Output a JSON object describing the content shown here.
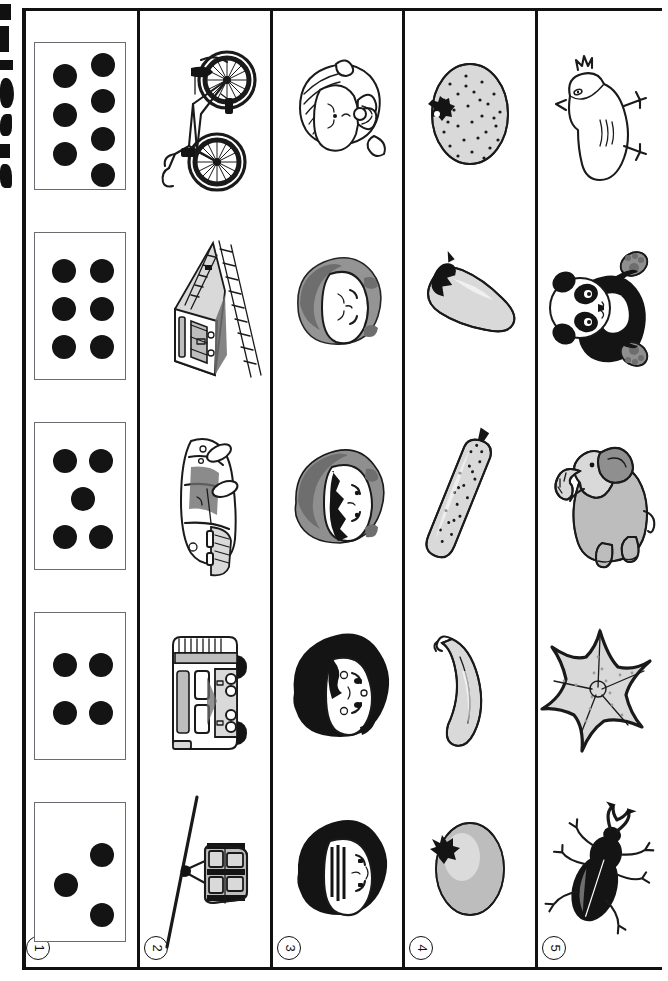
{
  "worksheet": {
    "title": "Matching worksheet: dot cards, vehicles, children, produce, animals",
    "orientation": "rotated-90",
    "frame_color": "#111111",
    "background_color": "#ffffff",
    "column_count": 5,
    "row_count": 5
  },
  "columns": [
    {
      "number": "1",
      "number_glyph": "①",
      "name": "dot-cards",
      "items": [
        {
          "name": "dot-card-seven",
          "dot_count": 7,
          "pattern": "3-left-4-right",
          "dots": [
            [
              30,
              33
            ],
            [
              30,
              72
            ],
            [
              30,
              111
            ],
            [
              68,
              22
            ],
            [
              68,
              58
            ],
            [
              68,
              96
            ],
            [
              68,
              132
            ]
          ]
        },
        {
          "name": "dot-card-six",
          "dot_count": 6,
          "pattern": "two-columns-of-three",
          "dots": [
            [
              29,
              38
            ],
            [
              29,
              76
            ],
            [
              29,
              114
            ],
            [
              67,
              38
            ],
            [
              67,
              76
            ],
            [
              67,
              114
            ]
          ]
        },
        {
          "name": "dot-card-five",
          "dot_count": 5,
          "pattern": "quincunx",
          "dots": [
            [
              30,
              38
            ],
            [
              66,
              38
            ],
            [
              48,
              76
            ],
            [
              30,
              114
            ],
            [
              66,
              114
            ]
          ]
        },
        {
          "name": "dot-card-four",
          "dot_count": 4,
          "pattern": "square",
          "dots": [
            [
              30,
              52
            ],
            [
              66,
              52
            ],
            [
              30,
              100
            ],
            [
              66,
              100
            ]
          ]
        },
        {
          "name": "dot-card-three",
          "dot_count": 3,
          "pattern": "diagonal",
          "dots": [
            [
              31,
              82
            ],
            [
              67,
              52
            ],
            [
              67,
              112
            ]
          ]
        }
      ]
    },
    {
      "number": "2",
      "number_glyph": "②",
      "name": "vehicles",
      "items": [
        {
          "name": "bicycle-picture",
          "label": "bicycle"
        },
        {
          "name": "train-picture",
          "label": "train on tracks"
        },
        {
          "name": "car-picture",
          "label": "car"
        },
        {
          "name": "bus-picture",
          "label": "bus"
        },
        {
          "name": "cable-car-picture",
          "label": "cable car gondola"
        }
      ]
    },
    {
      "number": "3",
      "number_glyph": "③",
      "name": "children-faces",
      "items": [
        {
          "name": "child-face-with-bow-picture",
          "label": "girl with ribbon bow"
        },
        {
          "name": "child-face-short-hair-picture",
          "label": "child with short hair"
        },
        {
          "name": "child-face-bangs-picture",
          "label": "child with bangs"
        },
        {
          "name": "child-face-dark-hair-picture",
          "label": "girl with dark curly hair"
        },
        {
          "name": "child-face-cap-picture",
          "label": "boy with straight hair"
        }
      ]
    },
    {
      "number": "4",
      "number_glyph": "④",
      "name": "produce",
      "items": [
        {
          "name": "strawberry-picture",
          "label": "strawberry"
        },
        {
          "name": "eggplant-picture",
          "label": "eggplant"
        },
        {
          "name": "cucumber-picture",
          "label": "cucumber"
        },
        {
          "name": "banana-picture",
          "label": "banana"
        },
        {
          "name": "potato-picture",
          "label": "potato"
        }
      ]
    },
    {
      "number": "5",
      "number_glyph": "⑤",
      "name": "animals",
      "items": [
        {
          "name": "chick-picture",
          "label": "chick"
        },
        {
          "name": "panda-picture",
          "label": "panda"
        },
        {
          "name": "elephant-picture",
          "label": "elephant"
        },
        {
          "name": "starfish-picture",
          "label": "starfish"
        },
        {
          "name": "beetle-picture",
          "label": "stag beetle"
        }
      ]
    }
  ],
  "colors": {
    "ink": "#1a1a1a",
    "dot": "#141414",
    "card_border": "#6b6b72",
    "gray_light": "#d9d9d9",
    "gray_mid": "#8f8f8f",
    "gray_dark": "#6e6e6e"
  }
}
